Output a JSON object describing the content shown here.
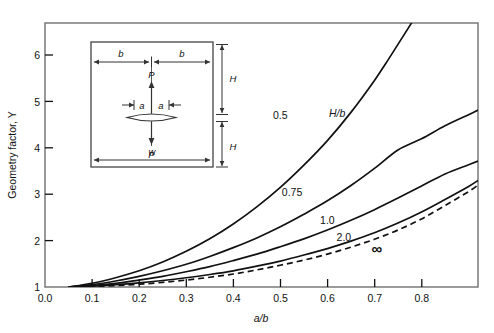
{
  "chart_data": {
    "type": "line",
    "title": "",
    "xlabel": "a/b",
    "ylabel": "Geometry factor, Y",
    "xlim": [
      0.0,
      0.92
    ],
    "ylim": [
      1.0,
      6.7
    ],
    "xticks": [
      0.0,
      0.1,
      0.2,
      0.3,
      0.4,
      0.5,
      0.6,
      0.7,
      0.8
    ],
    "xticklabels": [
      "0.0",
      "0.1",
      "0.2",
      "0.3",
      "0.4",
      "0.5",
      "0.6",
      "0.7",
      "0.8"
    ],
    "yticks": [
      1,
      2,
      3,
      4,
      5,
      6
    ],
    "yticklabels": [
      "1",
      "2",
      "3",
      "4",
      "5",
      "6"
    ],
    "grid": false,
    "legend_position": "inline-curve-labels",
    "legend_title": "H/b",
    "series": [
      {
        "name": "0.5",
        "label": "0.5",
        "style": "solid",
        "label_x": 0.5,
        "label_y": 4.62,
        "points": [
          [
            0.05,
            1.0
          ],
          [
            0.1,
            1.08
          ],
          [
            0.15,
            1.2
          ],
          [
            0.2,
            1.35
          ],
          [
            0.25,
            1.54
          ],
          [
            0.3,
            1.77
          ],
          [
            0.35,
            2.04
          ],
          [
            0.4,
            2.36
          ],
          [
            0.45,
            2.73
          ],
          [
            0.5,
            3.15
          ],
          [
            0.55,
            3.63
          ],
          [
            0.6,
            4.16
          ],
          [
            0.65,
            4.77
          ],
          [
            0.7,
            5.46
          ],
          [
            0.73,
            5.92
          ],
          [
            0.76,
            6.4
          ],
          [
            0.78,
            6.72
          ]
        ]
      },
      {
        "name": "0.75",
        "label": "0.75",
        "style": "solid",
        "label_x": 0.525,
        "label_y": 2.97,
        "points": [
          [
            0.05,
            1.0
          ],
          [
            0.1,
            1.05
          ],
          [
            0.15,
            1.13
          ],
          [
            0.2,
            1.23
          ],
          [
            0.25,
            1.35
          ],
          [
            0.3,
            1.49
          ],
          [
            0.35,
            1.66
          ],
          [
            0.4,
            1.85
          ],
          [
            0.45,
            2.06
          ],
          [
            0.5,
            2.3
          ],
          [
            0.55,
            2.57
          ],
          [
            0.6,
            2.86
          ],
          [
            0.65,
            3.19
          ],
          [
            0.7,
            3.56
          ],
          [
            0.75,
            3.96
          ],
          [
            0.8,
            4.2
          ],
          [
            0.85,
            4.48
          ],
          [
            0.9,
            4.72
          ],
          [
            0.92,
            4.82
          ]
        ]
      },
      {
        "name": "1.0",
        "label": "1.0",
        "style": "solid",
        "label_x": 0.6,
        "label_y": 2.36,
        "points": [
          [
            0.05,
            1.0
          ],
          [
            0.1,
            1.03
          ],
          [
            0.15,
            1.08
          ],
          [
            0.2,
            1.15
          ],
          [
            0.25,
            1.23
          ],
          [
            0.3,
            1.33
          ],
          [
            0.35,
            1.44
          ],
          [
            0.4,
            1.57
          ],
          [
            0.45,
            1.71
          ],
          [
            0.5,
            1.87
          ],
          [
            0.55,
            2.04
          ],
          [
            0.6,
            2.23
          ],
          [
            0.65,
            2.44
          ],
          [
            0.7,
            2.67
          ],
          [
            0.75,
            2.92
          ],
          [
            0.8,
            3.18
          ],
          [
            0.85,
            3.44
          ],
          [
            0.9,
            3.64
          ],
          [
            0.92,
            3.72
          ]
        ]
      },
      {
        "name": "2.0",
        "label": "2.0",
        "style": "solid",
        "label_x": 0.635,
        "label_y": 1.99,
        "points": [
          [
            0.05,
            1.0
          ],
          [
            0.1,
            1.02
          ],
          [
            0.15,
            1.05
          ],
          [
            0.2,
            1.09
          ],
          [
            0.25,
            1.14
          ],
          [
            0.3,
            1.2
          ],
          [
            0.35,
            1.27
          ],
          [
            0.4,
            1.35
          ],
          [
            0.45,
            1.45
          ],
          [
            0.5,
            1.56
          ],
          [
            0.55,
            1.69
          ],
          [
            0.6,
            1.83
          ],
          [
            0.65,
            1.99
          ],
          [
            0.7,
            2.17
          ],
          [
            0.75,
            2.38
          ],
          [
            0.8,
            2.62
          ],
          [
            0.85,
            2.89
          ],
          [
            0.9,
            3.17
          ],
          [
            0.92,
            3.3
          ]
        ]
      },
      {
        "name": "infinity",
        "label": "∞",
        "style": "dashed",
        "label_x": 0.705,
        "label_y": 1.72,
        "points": [
          [
            0.05,
            1.0
          ],
          [
            0.1,
            1.01
          ],
          [
            0.15,
            1.03
          ],
          [
            0.2,
            1.06
          ],
          [
            0.25,
            1.1
          ],
          [
            0.3,
            1.15
          ],
          [
            0.35,
            1.21
          ],
          [
            0.4,
            1.28
          ],
          [
            0.45,
            1.37
          ],
          [
            0.5,
            1.47
          ],
          [
            0.55,
            1.58
          ],
          [
            0.6,
            1.71
          ],
          [
            0.65,
            1.86
          ],
          [
            0.7,
            2.03
          ],
          [
            0.75,
            2.23
          ],
          [
            0.8,
            2.47
          ],
          [
            0.85,
            2.76
          ],
          [
            0.9,
            3.06
          ],
          [
            0.92,
            3.2
          ]
        ]
      }
    ]
  },
  "inset": {
    "name": "center-cracked-plate-diagram",
    "labels": {
      "half_width_left": "b",
      "half_width_right": "b",
      "half_crack_left": "a",
      "half_crack_right": "a",
      "load_top": "P",
      "load_bottom": "P",
      "height_top": "H",
      "height_bottom": "H",
      "width": "w"
    }
  }
}
